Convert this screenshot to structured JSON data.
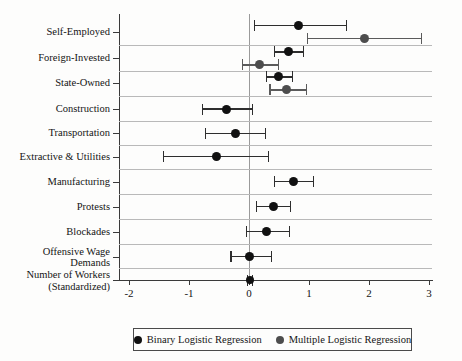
{
  "chart_data": {
    "type": "scatter",
    "title": "",
    "xlabel": "",
    "ylabel": "",
    "xlim": [
      -2.35,
      3.05
    ],
    "ylim": [
      0,
      11
    ],
    "grid": "horizontal row separators only",
    "zero_reference_line": 0,
    "legend_position": "below axes, centered",
    "xticks": [
      -2,
      -1,
      0,
      1,
      2,
      3
    ],
    "xticklabels": [
      "-2",
      "-1",
      "0",
      "1",
      "2",
      "3"
    ],
    "categories": [
      "Self-Employed",
      "Foreign-Invested",
      "State-Owned",
      "Construction",
      "Transportation",
      "Extractive & Utilities",
      "Manufacturing",
      "Protests",
      "Blockades",
      "Offensive Wage Demands",
      "Number of Workers (Standardized)"
    ],
    "category_labels": [
      {
        "lines": [
          "Self-Employed"
        ]
      },
      {
        "lines": [
          "Foreign-Invested"
        ]
      },
      {
        "lines": [
          "State-Owned"
        ]
      },
      {
        "lines": [
          "Construction"
        ]
      },
      {
        "lines": [
          "Transportation"
        ]
      },
      {
        "lines": [
          "Extractive & Utilities"
        ]
      },
      {
        "lines": [
          "Manufacturing"
        ]
      },
      {
        "lines": [
          "Protests"
        ]
      },
      {
        "lines": [
          "Blockades"
        ]
      },
      {
        "lines": [
          "Offensive Wage",
          "Demands"
        ]
      },
      {
        "lines": [
          "Number of Workers",
          "(Standardized)"
        ]
      }
    ],
    "series": [
      {
        "name": "Binary Logistic Regression",
        "color": "#111111",
        "points": [
          {
            "category": "Self-Employed",
            "estimate": 0.83,
            "ci_low": 0.08,
            "ci_high": 1.62
          },
          {
            "category": "Foreign-Invested",
            "estimate": 0.66,
            "ci_low": 0.41,
            "ci_high": 0.9
          },
          {
            "category": "State-Owned",
            "estimate": 0.49,
            "ci_low": 0.28,
            "ci_high": 0.71
          },
          {
            "category": "Construction",
            "estimate": -0.37,
            "ci_low": -0.79,
            "ci_high": 0.05
          },
          {
            "category": "Transportation",
            "estimate": -0.23,
            "ci_low": -0.74,
            "ci_high": 0.27
          },
          {
            "category": "Extractive & Utilities",
            "estimate": -0.55,
            "ci_low": -1.43,
            "ci_high": 0.32
          },
          {
            "category": "Manufacturing",
            "estimate": 0.74,
            "ci_low": 0.42,
            "ci_high": 1.06
          },
          {
            "category": "Protests",
            "estimate": 0.4,
            "ci_low": 0.12,
            "ci_high": 0.68
          },
          {
            "category": "Blockades",
            "estimate": 0.29,
            "ci_low": -0.05,
            "ci_high": 0.66
          },
          {
            "category": "Offensive Wage Demands",
            "estimate": 0.01,
            "ci_low": -0.31,
            "ci_high": 0.36
          },
          {
            "category": "Number of Workers (Standardized)",
            "estimate": 0.01,
            "ci_low": -0.03,
            "ci_high": 0.05
          }
        ]
      },
      {
        "name": "Multiple Logistic Regression",
        "color": "#4d4d4d",
        "points": [
          {
            "category": "Self-Employed",
            "estimate": 1.92,
            "ci_low": 0.97,
            "ci_high": 2.86
          },
          {
            "category": "Foreign-Invested",
            "estimate": 0.17,
            "ci_low": -0.12,
            "ci_high": 0.48
          },
          {
            "category": "State-Owned",
            "estimate": 0.63,
            "ci_low": 0.34,
            "ci_high": 0.95
          }
        ]
      }
    ]
  },
  "legend": {
    "items": [
      {
        "label": "Binary Logistic Regression",
        "marker": "filled-circle-black"
      },
      {
        "label": "Multiple Logistic Regression",
        "marker": "filled-circle-grey"
      }
    ]
  },
  "colors": {
    "binary_marker": "#111111",
    "multiple_marker": "#4d4d4d",
    "gridline": "#b9b9b9",
    "axis": "#3a3a3a",
    "zero_line": "#9a9a9a",
    "background": "#fdfdfc"
  }
}
